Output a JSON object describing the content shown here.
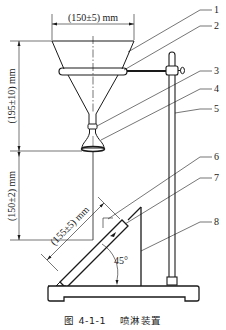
{
  "figure": {
    "caption_number": "图 4-1-1",
    "caption_title": "喷淋装置"
  },
  "dimensions": {
    "top_width": "(150±5) mm",
    "funnel_height": "(195±10) mm",
    "nozzle_to_specimen": "(150±2) mm",
    "specimen_length": "(155±5) mm",
    "angle": "45°"
  },
  "part_labels": [
    "1",
    "2",
    "3",
    "4",
    "5",
    "6",
    "7",
    "8"
  ],
  "colors": {
    "line": "#1a1a1a",
    "background": "#ffffff"
  }
}
